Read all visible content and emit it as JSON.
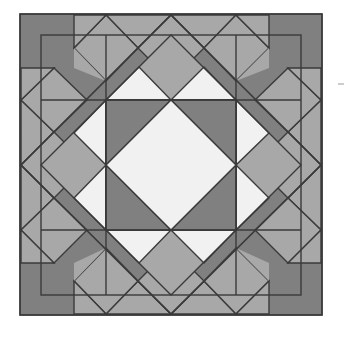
{
  "figure": {
    "canvas": {
      "width": 347,
      "height": 339
    },
    "background_color": "#ffffff"
  },
  "colors": {
    "page_background": "#ffffff",
    "dark_gray": "#808080",
    "medium_gray": "#a8a8a8",
    "light_gray": "#f1f1f1",
    "outline": "#3a3a3a",
    "outline_width": 1.4
  },
  "outer_square": {
    "name": "background-square",
    "fill": "#808080",
    "x": 20,
    "y": 14,
    "width": 302,
    "height": 301
  },
  "on_point_diamond": {
    "name": "on-point-diamond",
    "top": [
      171,
      15
    ],
    "right": [
      321,
      165
    ],
    "bottom": [
      171,
      314
    ],
    "left": [
      21,
      165
    ]
  },
  "inner_square": {
    "name": "star-block-square",
    "x": 74,
    "y": 68,
    "size": 195,
    "cell": 65
  },
  "shapes": {
    "center_diamond": {
      "label": "center-diamond",
      "fill": "#f1f1f1",
      "points": "171,100 236,165 171,230 106,165"
    },
    "corner_triangles_dark": [
      {
        "label": "corner-triangle-top-left",
        "fill": "#808080",
        "points": "106,100 171,100 106,165"
      },
      {
        "label": "corner-triangle-top-right",
        "fill": "#808080",
        "points": "171,100 236,100 236,165"
      },
      {
        "label": "corner-triangle-bottom-right",
        "fill": "#808080",
        "points": "236,165 236,230 171,230"
      },
      {
        "label": "corner-triangle-bottom-left",
        "fill": "#808080",
        "points": "106,165 171,230 106,230"
      }
    ],
    "star_points_light": [
      {
        "label": "star-point-top",
        "fill": "#f1f1f1",
        "points": "106,100 171,35 236,100"
      },
      {
        "label": "star-point-right",
        "fill": "#f1f1f1",
        "points": "236,100 301,165 236,230"
      },
      {
        "label": "star-point-bottom",
        "fill": "#f1f1f1",
        "points": "236,230 171,295 106,230"
      },
      {
        "label": "star-point-left",
        "fill": "#f1f1f1",
        "points": "106,230 41,165 106,100"
      }
    ],
    "star_points_medium": [
      {
        "label": "star-point-top-left-wedge",
        "fill": "#a8a8a8",
        "points": "106,100 171,35 139,67"
      },
      {
        "label": "star-point-top-right-wedge",
        "fill": "#a8a8a8",
        "points": "171,35 236,100 204,67"
      },
      {
        "label": "star-point-right-top-wedge",
        "fill": "#a8a8a8",
        "points": "236,100 301,165 269,133"
      },
      {
        "label": "star-point-right-bottom-wedge",
        "fill": "#a8a8a8",
        "points": "301,165 236,230 269,198"
      },
      {
        "label": "star-point-bottom-right-wedge",
        "fill": "#a8a8a8",
        "points": "236,230 171,295 204,263"
      },
      {
        "label": "star-point-bottom-left-wedge",
        "fill": "#a8a8a8",
        "points": "171,295 106,230 139,263"
      },
      {
        "label": "star-point-left-bottom-wedge",
        "fill": "#a8a8a8",
        "points": "106,230 41,165 74,198"
      },
      {
        "label": "star-point-left-top-wedge",
        "fill": "#a8a8a8",
        "points": "41,165 106,100 74,133"
      }
    ],
    "corner_units": [
      {
        "label": "corner-unit-top",
        "center_square": {
          "fill": "#a8a8a8",
          "points": "171,15 204,48 171,81 138,48"
        },
        "pieces": [
          {
            "label": "corner-piece-top-left",
            "fill": "#a8a8a8",
            "points": "171,15 138,48 106,15"
          },
          {
            "label": "corner-piece-top-right",
            "fill": "#a8a8a8",
            "points": "171,15 204,48 236,15"
          },
          {
            "label": "corner-piece-left-bar",
            "fill": "#a8a8a8",
            "points": "106,15 138,48 106,81 74,48"
          },
          {
            "label": "corner-piece-right-bar",
            "fill": "#a8a8a8",
            "points": "236,15 269,48 236,81 204,48"
          }
        ]
      },
      {
        "label": "corner-unit-right",
        "center_square": {
          "fill": "#a8a8a8",
          "points": "321,165 288,198 255,165 288,132"
        }
      },
      {
        "label": "corner-unit-bottom",
        "center_square": {
          "fill": "#a8a8a8",
          "points": "171,314 138,281 171,248 204,281"
        }
      },
      {
        "label": "corner-unit-left",
        "center_square": {
          "fill": "#a8a8a8",
          "points": "21,165 54,132 87,165 54,198"
        }
      }
    ]
  },
  "legend": {
    "items": [
      {
        "swatch": "#808080",
        "label": "Dark gray"
      },
      {
        "swatch": "#a8a8a8",
        "label": "Medium gray"
      },
      {
        "swatch": "#f1f1f1",
        "label": "Light gray"
      }
    ]
  }
}
